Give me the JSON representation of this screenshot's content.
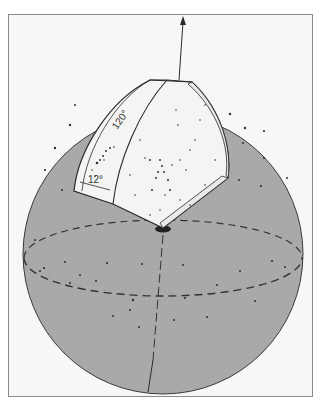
{
  "figure": {
    "labels": {
      "angle_wide": "120°",
      "angle_thin": "12°"
    },
    "colors": {
      "sphere_fill": "#a8a8a6",
      "wedge_fill": "#f4f4f2",
      "frame_bg": "#f7f7f6",
      "line": "#2a2a2a"
    }
  }
}
